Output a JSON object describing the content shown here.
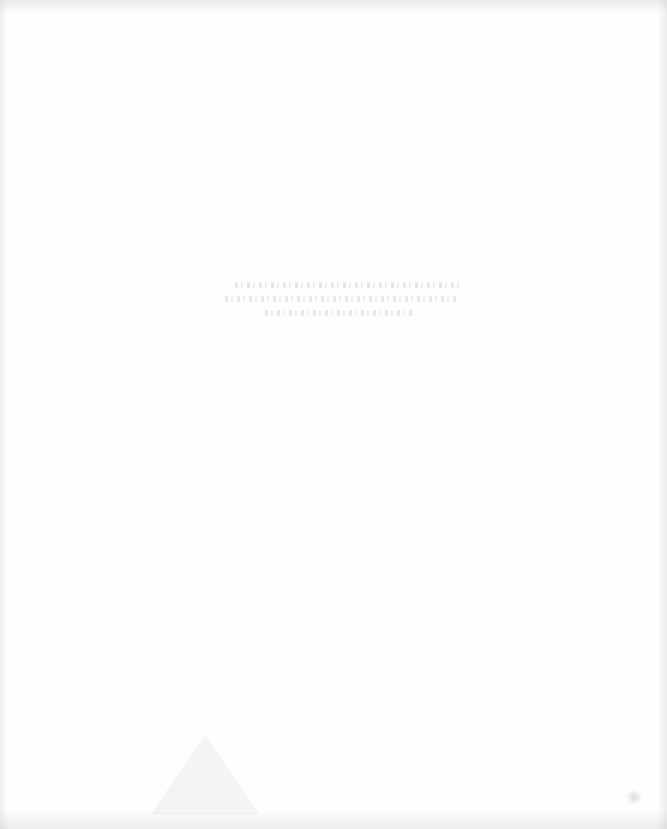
{
  "document": {
    "type": "scanned-page",
    "state": "nearly blank",
    "visible_text": [],
    "note": "Faint illegible bleed-through text (3 lines) centered near upper-middle",
    "colors": {
      "background": "#fefefe",
      "bleed_through": "#bebebe"
    }
  }
}
